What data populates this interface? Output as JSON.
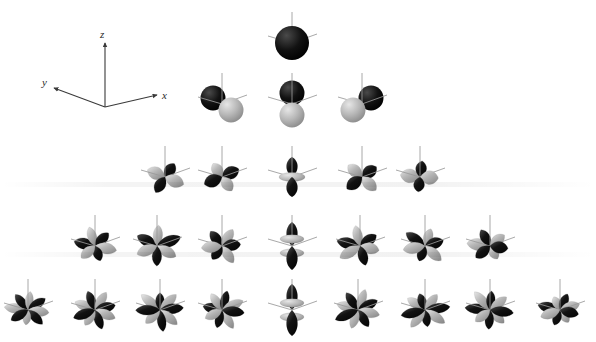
{
  "figure": {
    "background_color": "#ffffff",
    "width": 596,
    "height": 342
  },
  "axis_legend": {
    "name": "coordinate-axes",
    "origin": [
      105,
      107
    ],
    "axes": [
      {
        "label": "z",
        "tip": [
          105,
          40
        ],
        "label_pos": [
          101,
          33
        ]
      },
      {
        "label": "x",
        "tip": [
          160,
          96
        ],
        "label_pos": [
          163,
          100
        ]
      },
      {
        "label": "y",
        "tip": [
          52,
          89
        ],
        "label_pos": [
          44,
          90
        ]
      }
    ],
    "line_color": "#3a3a3a"
  },
  "colors": {
    "positive_lobe": "#121212",
    "positive_lobe_highlight": "#4a4a4a",
    "negative_lobe": "#b6b6b6",
    "negative_lobe_highlight": "#e6e6e6",
    "negative_lobe_shade": "#8a8a8a",
    "axis_stick": "#9a9a9a",
    "background": "#ffffff"
  },
  "rows": [
    {
      "shell": "s",
      "l": 0,
      "count": 1,
      "y": 43,
      "orbitals": [
        {
          "name": "s",
          "x": 292,
          "kind": "s"
        }
      ]
    },
    {
      "shell": "p",
      "l": 1,
      "count": 3,
      "y": 104,
      "orbitals": [
        {
          "name": "p-x",
          "x": 222,
          "kind": "p",
          "axis": "x"
        },
        {
          "name": "p-z",
          "x": 292,
          "kind": "p",
          "axis": "z"
        },
        {
          "name": "p-y",
          "x": 362,
          "kind": "p",
          "axis": "y"
        }
      ]
    },
    {
      "shell": "d",
      "l": 2,
      "count": 5,
      "y": 177,
      "orbitals": [
        {
          "name": "d-xy",
          "x": 165,
          "kind": "cloverA"
        },
        {
          "name": "d-yz",
          "x": 222,
          "kind": "cloverB"
        },
        {
          "name": "d-z2",
          "x": 292,
          "kind": "dz2"
        },
        {
          "name": "d-xz",
          "x": 362,
          "kind": "cloverC"
        },
        {
          "name": "d-x2-y2",
          "x": 420,
          "kind": "cloverD"
        }
      ]
    },
    {
      "shell": "f",
      "l": 3,
      "count": 7,
      "y": 246,
      "orbitals": [
        {
          "name": "f-1",
          "x": 95,
          "kind": "f6a"
        },
        {
          "name": "f-2",
          "x": 157,
          "kind": "f6b"
        },
        {
          "name": "f-3",
          "x": 222,
          "kind": "f6c"
        },
        {
          "name": "f-4",
          "x": 292,
          "kind": "fz3"
        },
        {
          "name": "f-5",
          "x": 360,
          "kind": "f6d"
        },
        {
          "name": "f-6",
          "x": 425,
          "kind": "f6e"
        },
        {
          "name": "f-7",
          "x": 490,
          "kind": "f6f"
        }
      ]
    },
    {
      "shell": "g",
      "l": 4,
      "count": 9,
      "y": 310,
      "orbitals": [
        {
          "name": "g-1",
          "x": 28,
          "kind": "g8a"
        },
        {
          "name": "g-2",
          "x": 95,
          "kind": "g8b"
        },
        {
          "name": "g-3",
          "x": 160,
          "kind": "g8c"
        },
        {
          "name": "g-4",
          "x": 222,
          "kind": "g8d"
        },
        {
          "name": "g-5",
          "x": 292,
          "kind": "gz4"
        },
        {
          "name": "g-6",
          "x": 358,
          "kind": "g8e"
        },
        {
          "name": "g-7",
          "x": 425,
          "kind": "g8f"
        },
        {
          "name": "g-8",
          "x": 490,
          "kind": "g8g"
        },
        {
          "name": "g-9",
          "x": 560,
          "kind": "g8h"
        }
      ]
    }
  ],
  "shadow_bands": [
    {
      "y": 182,
      "name": "shadow-band-d-row"
    },
    {
      "y": 252,
      "name": "shadow-band-f-row"
    }
  ]
}
